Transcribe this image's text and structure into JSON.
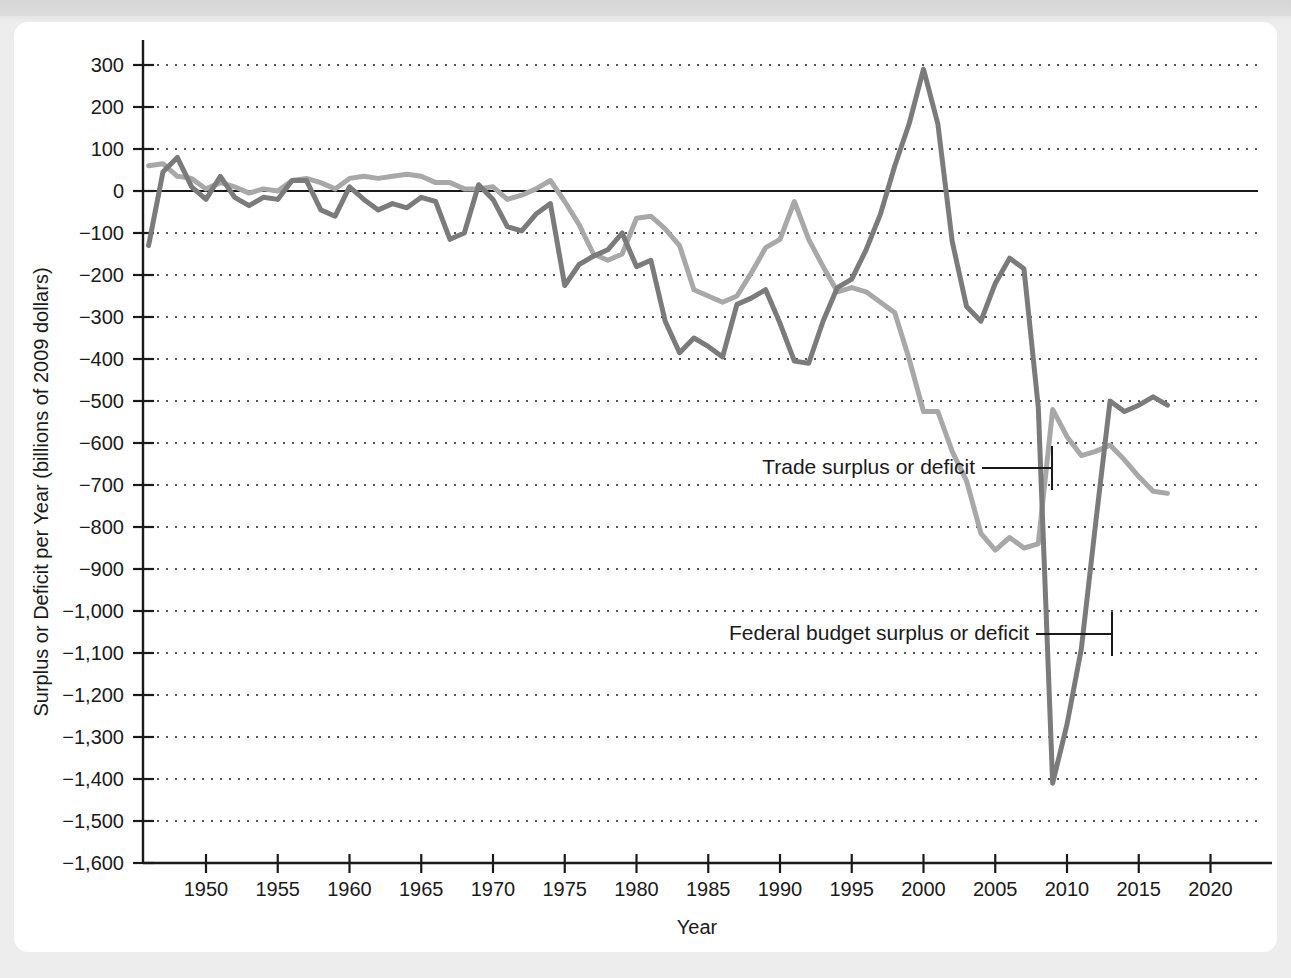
{
  "figure": {
    "background_color": "#ededed",
    "card_color": "#ffffff"
  },
  "chart_data": {
    "type": "line",
    "title": "",
    "xlabel": "Year",
    "ylabel": "Surplus or Deficit per Year (billions of 2009 dollars)",
    "xlim": [
      1946,
      2021
    ],
    "ylim": [
      -1600,
      350
    ],
    "grid": true,
    "legend_position": "inline-annotations",
    "x_ticks": [
      1950,
      1955,
      1960,
      1965,
      1970,
      1975,
      1980,
      1985,
      1990,
      1995,
      2000,
      2005,
      2010,
      2015,
      2020
    ],
    "x_tick_labels": [
      "1950",
      "1955",
      "1960",
      "1965",
      "1970",
      "1975",
      "1980",
      "1985",
      "1990",
      "1995",
      "2000",
      "2005",
      "2010",
      "2015",
      "2020"
    ],
    "y_ticks": [
      300,
      200,
      100,
      0,
      -100,
      -200,
      -300,
      -400,
      -500,
      -600,
      -700,
      -800,
      -900,
      -1000,
      -1100,
      -1200,
      -1300,
      -1400,
      -1500,
      -1600
    ],
    "y_tick_labels": [
      "300",
      "200",
      "100",
      "0",
      "−100",
      "−200",
      "−300",
      "−400",
      "−500",
      "−600",
      "−700",
      "−800",
      "−900",
      "−1,000",
      "−1,100",
      "−1,200",
      "−1,300",
      "−1,400",
      "−1,500",
      "−1,600"
    ],
    "zero_line": 0,
    "x": [
      1946,
      1947,
      1948,
      1949,
      1950,
      1951,
      1952,
      1953,
      1954,
      1955,
      1956,
      1957,
      1958,
      1959,
      1960,
      1961,
      1962,
      1963,
      1964,
      1965,
      1966,
      1967,
      1968,
      1969,
      1970,
      1971,
      1972,
      1973,
      1974,
      1975,
      1976,
      1977,
      1978,
      1979,
      1980,
      1981,
      1982,
      1983,
      1984,
      1985,
      1986,
      1987,
      1988,
      1989,
      1990,
      1991,
      1992,
      1993,
      1994,
      1995,
      1996,
      1997,
      1998,
      1999,
      2000,
      2001,
      2002,
      2003,
      2004,
      2005,
      2006,
      2007,
      2008,
      2009,
      2010,
      2011,
      2012,
      2013,
      2014,
      2015,
      2016,
      2017
    ],
    "series": [
      {
        "name": "Federal budget surplus or deficit",
        "color": "#7b7b7b",
        "values": [
          -130,
          45,
          80,
          10,
          -20,
          35,
          -15,
          -35,
          -15,
          -20,
          25,
          25,
          -45,
          -60,
          10,
          -20,
          -45,
          -30,
          -40,
          -15,
          -25,
          -115,
          -100,
          15,
          -20,
          -85,
          -95,
          -55,
          -30,
          -225,
          -175,
          -155,
          -140,
          -100,
          -180,
          -165,
          -310,
          -385,
          -350,
          -370,
          -395,
          -270,
          -255,
          -235,
          -315,
          -405,
          -410,
          -310,
          -230,
          -210,
          -140,
          -55,
          60,
          160,
          290,
          160,
          -120,
          -275,
          -310,
          -220,
          -160,
          -185,
          -515,
          -1410,
          -1270,
          -1090,
          -790,
          -500,
          -525,
          -510,
          -490,
          -510
        ]
      },
      {
        "name": "Trade surplus or deficit",
        "color": "#a8a8a8",
        "values": [
          60,
          65,
          35,
          30,
          5,
          20,
          10,
          -5,
          5,
          0,
          25,
          30,
          20,
          5,
          30,
          35,
          30,
          35,
          40,
          35,
          20,
          20,
          5,
          5,
          10,
          -20,
          -10,
          5,
          25,
          -25,
          -80,
          -150,
          -165,
          -150,
          -65,
          -60,
          -90,
          -130,
          -235,
          -250,
          -265,
          -250,
          -195,
          -135,
          -115,
          -25,
          -115,
          -180,
          -240,
          -230,
          -240,
          -265,
          -290,
          -400,
          -525,
          -525,
          -620,
          -690,
          -815,
          -855,
          -825,
          -850,
          -840,
          -520,
          -585,
          -630,
          -620,
          -605,
          -640,
          -680,
          -715,
          -720
        ]
      }
    ],
    "annotations": [
      {
        "text": "Trade surplus or deficit",
        "points_to_series": "Trade surplus or deficit",
        "at_x": 2000,
        "at_y": -650
      },
      {
        "text": "Federal budget surplus or deficit",
        "points_to_series": "Federal budget surplus or deficit",
        "at_x": 2009,
        "at_y": -1050
      }
    ]
  }
}
